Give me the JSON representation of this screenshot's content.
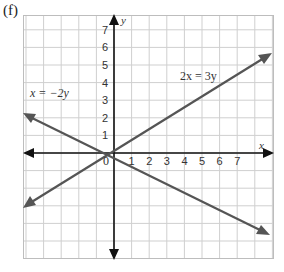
{
  "figure": {
    "panel_label": "(f)",
    "x_axis_label": "x",
    "y_axis_label": "y",
    "origin_label": "0",
    "x_ticks": [
      "1",
      "2",
      "3",
      "4",
      "5",
      "6",
      "7"
    ],
    "y_ticks": [
      "1",
      "2",
      "3",
      "4",
      "5",
      "6",
      "7"
    ],
    "lines": [
      {
        "label": "x = −2y",
        "equation": "x = -2y"
      },
      {
        "label": "2x = 3y",
        "equation": "2x = 3y"
      }
    ]
  },
  "chart_data": {
    "type": "line",
    "title": "(f)",
    "xlabel": "x",
    "ylabel": "y",
    "xlim": [
      -5,
      9
    ],
    "ylim": [
      -6,
      8
    ],
    "grid": true,
    "series": [
      {
        "name": "x = -2y",
        "x": [
          -5,
          9
        ],
        "y": [
          2.5,
          -4.5
        ]
      },
      {
        "name": "2x = 3y",
        "x": [
          -5,
          9
        ],
        "y": [
          -3.33,
          6
        ]
      }
    ],
    "annotations": [
      "x = -2y",
      "2x = 3y"
    ]
  }
}
